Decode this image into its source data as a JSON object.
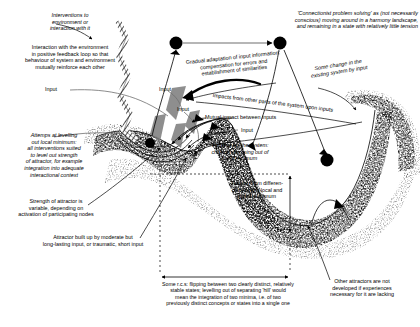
{
  "figure": {
    "type": "conceptual-diagram",
    "background_color": "#ffffff",
    "ink_color": "#000000",
    "accent_gray": "#808080"
  },
  "annotations": {
    "interventions": "Interventions to\nenvironment or\ninteraction with it",
    "feedback_loop": "Interaction with the environment\nin positive feedback loop so that\nbehaviour of system and environment\nmutually reinforce each other",
    "connectionist": "'Connectionist problem solving' as (not necessarily\nconscious) moving around in a harmony landscape,\nand remaining in a state with relatively little tension",
    "gradual_adaptation": "Gradual adaptation of input information:\ncompensation for errors and\nestablishment of similarities",
    "some_change": "Some change in the\nexisting system by input",
    "impacts_other_parts": "Impacts from other parts of the system upon inputs",
    "mutual_impact": "Mutual impact between inputs",
    "heating_up": "'Heating up' the system:\nchance of coming out of\nlocal minimum",
    "levelling_out": "Attemps at levelling\nout local minimum:\nall interventions suited\nto level out strength\nof attractor, for example\nintegration into adequate\ninteractional context",
    "strength_of_attractor": "Strength of attractor is\nvariable, depending on\nactivation of participating nodes",
    "attractor_built_up": "Attractor built up by moderate but\nlong-lasting input, or traumatic, short input",
    "tension": "Tension from differen-\nce between local and\nglobal minimum",
    "some_rcs": "Some r.c.s: flipping between two clearly distinct, relatively\nstable states; levelling out of separating 'hill' would\nmean the integration of two minima, i.e. of two\npreviously distinct concepts or states into a single one",
    "other_attractors": "Other attractors are not\ndeveloped if experiences\nnecessary for it are lacking"
  },
  "input_labels": {
    "input_1": "Input",
    "input_2": "Input",
    "input_3": "Input",
    "input_4": "Input"
  },
  "nodes": [
    {
      "name": "node-left-top",
      "cx": 176,
      "cy": 43,
      "r": 6.5
    },
    {
      "name": "node-right-top",
      "cx": 280,
      "cy": 43,
      "r": 6.5
    },
    {
      "name": "node-ball-in-local-minimum",
      "cx": 150,
      "cy": 143,
      "r": 5.0
    },
    {
      "name": "node-lower-right",
      "cx": 327,
      "cy": 160,
      "r": 6.5
    }
  ],
  "landscape": {
    "description": "Stippled harmony landscape cross-section: shallow local minimum on the left, separating hill in the middle, deep global minimum on the right, with steep right wall and a small secondary undeveloped dip.",
    "local_minimum_x": 160,
    "hill_peak_x": 190,
    "global_minimum_x": 290
  },
  "measures": {
    "tension_arrow": "vertical double-headed arrow between local-minimum level and global minimum",
    "rcs_arrow": "horizontal double-headed arrow spanning the two minima"
  }
}
